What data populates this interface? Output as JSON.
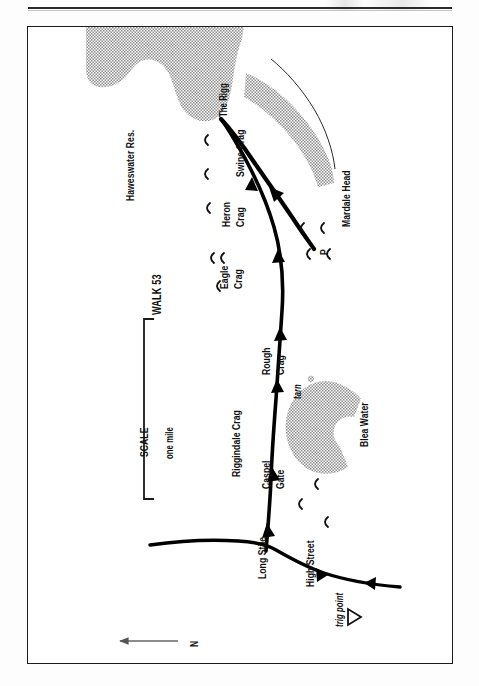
{
  "page": {
    "domain": "Map",
    "width": 479,
    "height": 686,
    "background_color": "#ffffff",
    "orientation_note": "Map is printed sideways on the page; all map labels are rotated 90 degrees counter-clockwise."
  },
  "header": {
    "rule_color": "#2b2b2b"
  },
  "map": {
    "title": "WALK 53",
    "frame_color": "#1c1c1c",
    "water_fill": "#b6b6b6",
    "route_color": "#000000",
    "scale": {
      "label": "SCALE",
      "distance_label": "one mile"
    },
    "compass": {
      "label": "N",
      "direction": "arrow pointing north (to page left)"
    },
    "features": [
      {
        "id": "haweswater",
        "label": "Haweswater Res.",
        "type": "water-body"
      },
      {
        "id": "the-rigg",
        "label": "The Rigg",
        "type": "place"
      },
      {
        "id": "swine-crag",
        "label": "Swine Crag",
        "type": "crag"
      },
      {
        "id": "heron-crag",
        "label": "Heron",
        "label2": "Crag",
        "type": "crag"
      },
      {
        "id": "eagle-crag",
        "label": "Eagle",
        "label2": "Crag",
        "type": "crag"
      },
      {
        "id": "riggindale",
        "label": "Riggindale Crag",
        "type": "crag"
      },
      {
        "id": "rough-crag",
        "label": "Rough",
        "label2": "Crag",
        "type": "crag"
      },
      {
        "id": "caspel-gate",
        "label": "Caspel",
        "label2": "Gate",
        "type": "place"
      },
      {
        "id": "tarn",
        "label": "tarn",
        "type": "tarn"
      },
      {
        "id": "blea-water",
        "label": "Blea Water",
        "type": "water-body"
      },
      {
        "id": "long-stile",
        "label": "Long Stile",
        "type": "ridge"
      },
      {
        "id": "high-street",
        "label": "High Street",
        "type": "ridge"
      },
      {
        "id": "trig-point",
        "label": "trig point",
        "type": "trig-point"
      },
      {
        "id": "mardale-head",
        "label": "Mardale Head",
        "type": "place"
      },
      {
        "id": "parking",
        "label": "P",
        "type": "car-park"
      }
    ]
  }
}
